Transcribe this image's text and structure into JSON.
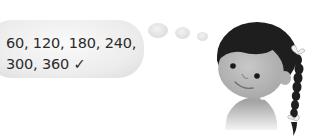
{
  "thought_bubble": {
    "line1": "60, 120, 180, 240,",
    "line2": "300, 360",
    "check": "✓"
  },
  "character": {
    "description": "girl with dark hair and a long braid"
  },
  "colors": {
    "bubble": "#e6e6e6",
    "text": "#2b2b2b",
    "hair": "#1e1e1e",
    "skin": "#b8b8b8"
  }
}
